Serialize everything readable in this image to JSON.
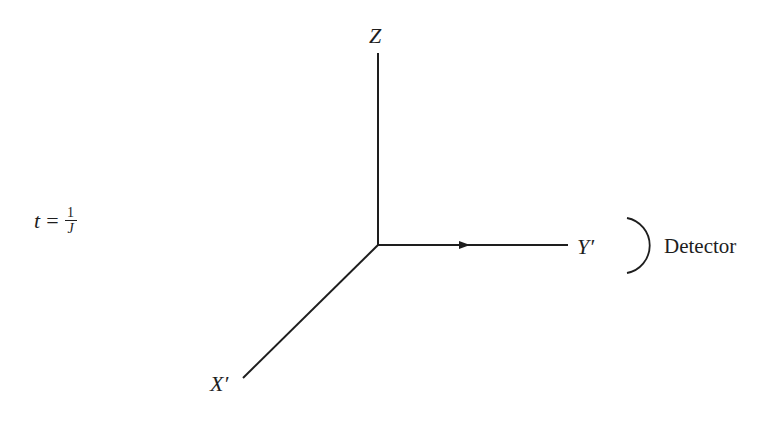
{
  "diagram": {
    "equation": {
      "variable": "t",
      "equals": "=",
      "numerator": "1",
      "denominator": "J"
    },
    "axes": {
      "z_label": "Z",
      "y_label": "Y′",
      "x_label": "X′"
    },
    "detector_label": "Detector",
    "colors": {
      "stroke": "#1e1e1e",
      "background": "#ffffff"
    }
  }
}
